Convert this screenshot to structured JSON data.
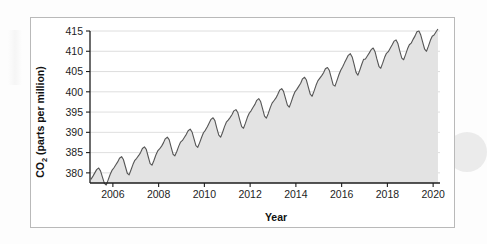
{
  "figure": {
    "background_color": "#ffffff",
    "border_color": "#b9b9b9",
    "page_background": "#fdfdfd"
  },
  "chart_data": {
    "type": "area",
    "title": "",
    "xlabel": "Year",
    "ylabel": "CO2 (parts per million)",
    "ylabel_main": "CO",
    "ylabel_subscript": "2",
    "ylabel_rest": " (parts per million)",
    "xlim": [
      2005.0,
      2020.3
    ],
    "ylim": [
      377.5,
      415.0
    ],
    "xticks": [
      2006,
      2008,
      2010,
      2012,
      2014,
      2016,
      2018,
      2020
    ],
    "xtick_labels": [
      "2006",
      "2008",
      "2010",
      "2012",
      "2014",
      "2016",
      "2018",
      "2020"
    ],
    "yticks": [
      380,
      385,
      390,
      395,
      400,
      405,
      410,
      415
    ],
    "ytick_labels": [
      "380",
      "385",
      "390",
      "395",
      "400",
      "405",
      "410",
      "415"
    ],
    "grid": "horizontal",
    "grid_color": "#d6d6d6",
    "legend": "none",
    "line_color": "#555555",
    "fill_color": "#e3e3e3",
    "line_width": 1.1,
    "series": [
      {
        "name": "Atmospheric CO2 monthly mean (Mauna Loa)",
        "x": [
          2005.04,
          2005.13,
          2005.21,
          2005.29,
          2005.38,
          2005.46,
          2005.54,
          2005.63,
          2005.71,
          2005.79,
          2005.88,
          2005.96,
          2006.04,
          2006.13,
          2006.21,
          2006.29,
          2006.38,
          2006.46,
          2006.54,
          2006.63,
          2006.71,
          2006.79,
          2006.88,
          2006.96,
          2007.04,
          2007.13,
          2007.21,
          2007.29,
          2007.38,
          2007.46,
          2007.54,
          2007.63,
          2007.71,
          2007.79,
          2007.88,
          2007.96,
          2008.04,
          2008.13,
          2008.21,
          2008.29,
          2008.38,
          2008.46,
          2008.54,
          2008.63,
          2008.71,
          2008.79,
          2008.88,
          2008.96,
          2009.04,
          2009.13,
          2009.21,
          2009.29,
          2009.38,
          2009.46,
          2009.54,
          2009.63,
          2009.71,
          2009.79,
          2009.88,
          2009.96,
          2010.04,
          2010.13,
          2010.21,
          2010.29,
          2010.38,
          2010.46,
          2010.54,
          2010.63,
          2010.71,
          2010.79,
          2010.88,
          2010.96,
          2011.04,
          2011.13,
          2011.21,
          2011.29,
          2011.38,
          2011.46,
          2011.54,
          2011.63,
          2011.71,
          2011.79,
          2011.88,
          2011.96,
          2012.04,
          2012.13,
          2012.21,
          2012.29,
          2012.38,
          2012.46,
          2012.54,
          2012.63,
          2012.71,
          2012.79,
          2012.88,
          2012.96,
          2013.04,
          2013.13,
          2013.21,
          2013.29,
          2013.38,
          2013.46,
          2013.54,
          2013.63,
          2013.71,
          2013.79,
          2013.88,
          2013.96,
          2014.04,
          2014.13,
          2014.21,
          2014.29,
          2014.38,
          2014.46,
          2014.54,
          2014.63,
          2014.71,
          2014.79,
          2014.88,
          2014.96,
          2015.04,
          2015.13,
          2015.21,
          2015.29,
          2015.38,
          2015.46,
          2015.54,
          2015.63,
          2015.71,
          2015.79,
          2015.88,
          2015.96,
          2016.04,
          2016.13,
          2016.21,
          2016.29,
          2016.38,
          2016.46,
          2016.54,
          2016.63,
          2016.71,
          2016.79,
          2016.88,
          2016.96,
          2017.04,
          2017.13,
          2017.21,
          2017.29,
          2017.38,
          2017.46,
          2017.54,
          2017.63,
          2017.71,
          2017.79,
          2017.88,
          2017.96,
          2018.04,
          2018.13,
          2018.21,
          2018.29,
          2018.38,
          2018.46,
          2018.54,
          2018.63,
          2018.71,
          2018.79,
          2018.88,
          2018.96,
          2019.04,
          2019.13,
          2019.21,
          2019.29,
          2019.38,
          2019.46,
          2019.54,
          2019.63,
          2019.71,
          2019.79,
          2019.88,
          2019.96,
          2020.04,
          2020.13,
          2020.21
        ],
        "y": [
          378.4,
          379.2,
          380.0,
          380.8,
          381.2,
          380.5,
          379.0,
          377.4,
          377.0,
          378.2,
          379.6,
          380.6,
          381.2,
          382.0,
          382.7,
          383.6,
          384.0,
          383.3,
          381.7,
          379.9,
          379.5,
          380.7,
          382.1,
          383.1,
          383.6,
          384.3,
          385.0,
          386.0,
          386.4,
          385.8,
          384.1,
          382.3,
          381.9,
          383.0,
          384.4,
          385.4,
          385.9,
          386.6,
          387.4,
          388.4,
          388.8,
          388.2,
          386.5,
          384.6,
          384.2,
          385.2,
          386.6,
          387.6,
          388.0,
          388.8,
          389.5,
          390.4,
          390.8,
          390.1,
          388.5,
          386.7,
          386.3,
          387.4,
          388.8,
          389.9,
          390.5,
          391.4,
          392.3,
          393.2,
          393.6,
          392.9,
          391.1,
          389.3,
          388.8,
          389.9,
          391.4,
          392.5,
          393.0,
          393.7,
          394.4,
          395.3,
          395.6,
          394.9,
          393.2,
          391.4,
          391.0,
          392.2,
          393.7,
          394.7,
          395.3,
          396.2,
          396.9,
          397.9,
          398.3,
          397.6,
          395.9,
          394.0,
          393.5,
          394.6,
          396.1,
          397.2,
          397.8,
          398.5,
          399.4,
          400.4,
          400.8,
          400.1,
          398.5,
          396.7,
          396.2,
          397.4,
          398.9,
          400.0,
          400.6,
          401.4,
          402.1,
          403.2,
          403.6,
          402.9,
          401.2,
          399.4,
          398.9,
          400.1,
          401.6,
          402.7,
          403.3,
          404.0,
          404.7,
          405.7,
          406.0,
          405.3,
          403.6,
          401.7,
          401.4,
          402.7,
          404.2,
          405.3,
          406.1,
          407.2,
          408.1,
          409.0,
          409.4,
          408.6,
          406.9,
          404.8,
          404.1,
          405.3,
          406.8,
          408.0,
          408.1,
          408.9,
          409.6,
          410.4,
          410.8,
          409.9,
          408.1,
          406.3,
          405.8,
          407.0,
          408.5,
          409.5,
          409.9,
          410.8,
          411.6,
          412.5,
          412.8,
          411.9,
          410.1,
          408.3,
          407.9,
          409.1,
          410.6,
          411.6,
          412.0,
          413.0,
          413.8,
          414.8,
          415.0,
          414.0,
          412.3,
          410.5,
          410.0,
          411.2,
          412.7,
          413.7,
          414.0,
          414.8,
          415.5
        ]
      }
    ]
  }
}
